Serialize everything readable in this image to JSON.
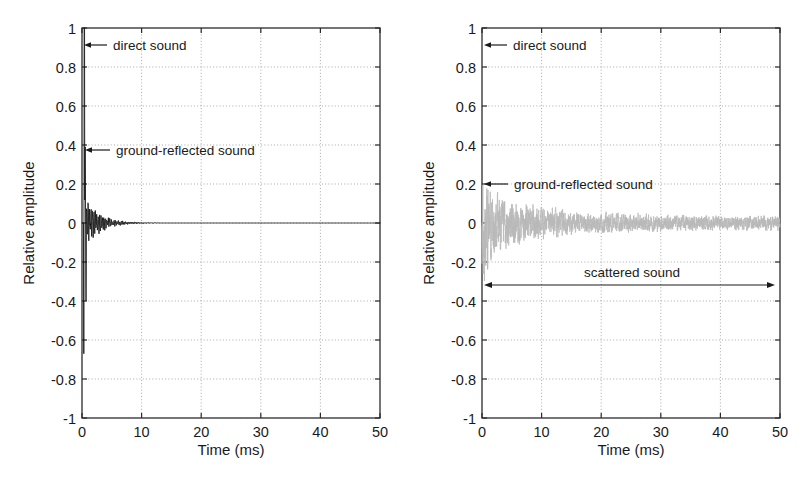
{
  "figure": {
    "background": "#ffffff",
    "panel_count": 2
  },
  "chart_data": [
    {
      "id": "left-panel",
      "type": "line",
      "title": "",
      "xlabel": "Time (ms)",
      "ylabel": "Relative amplitude",
      "xlim": [
        0,
        50
      ],
      "ylim": [
        -1,
        1
      ],
      "xticks": [
        0,
        10,
        20,
        30,
        40,
        50
      ],
      "xticklabels": [
        "0",
        "10",
        "20",
        "30",
        "40",
        "50"
      ],
      "yticks": [
        -1,
        -0.8,
        -0.6,
        -0.4,
        -0.2,
        0,
        0.2,
        0.4,
        0.6,
        0.8,
        1
      ],
      "yticklabels": [
        "-1",
        "-0.8",
        "-0.6",
        "-0.4",
        "-0.2",
        "0",
        "0.2",
        "0.4",
        "0.6",
        "0.8",
        "1"
      ],
      "grid": true,
      "grid_style": "dotted",
      "legend": "none",
      "series": [
        {
          "name": "impulse response (hard ground, free field)",
          "color": "#111111",
          "description": "Large direct-sound impulse near t=0 reaching +1 / -0.67, a ground-reflected impulse of about +0.40, then rapidly decaying oscillation settling to zero by about 12 ms."
        }
      ],
      "annotations": [
        {
          "name": "direct-sound",
          "text": "direct sound",
          "arrow": "left",
          "points_to_x_ms": 0.3,
          "points_to_y": 0.92
        },
        {
          "name": "ground-reflected-sound",
          "text": "ground-reflected sound",
          "arrow": "left",
          "points_to_x_ms": 0.5,
          "points_to_y": 0.4
        }
      ]
    },
    {
      "id": "right-panel",
      "type": "line",
      "title": "",
      "xlabel": "Time (ms)",
      "ylabel": "Relative amplitude",
      "xlim": [
        0,
        50
      ],
      "ylim": [
        -1,
        1
      ],
      "xticks": [
        0,
        10,
        20,
        30,
        40,
        50
      ],
      "xticklabels": [
        "0",
        "10",
        "20",
        "30",
        "40",
        "50"
      ],
      "yticks": [
        -1,
        -0.8,
        -0.6,
        -0.4,
        -0.2,
        0,
        0.2,
        0.4,
        0.6,
        0.8,
        1
      ],
      "yticklabels": [
        "-1",
        "-0.8",
        "-0.6",
        "-0.4",
        "-0.2",
        "0",
        "0.2",
        "0.4",
        "0.6",
        "0.8",
        "1"
      ],
      "grid": true,
      "grid_style": "dotted",
      "legend": "none",
      "series": [
        {
          "name": "impulse response (scattering ground)",
          "color": "#b9b9b9",
          "description": "Low-amplitude noisy signal, peaks about +0.19 / -0.28 in the first 10 ms, decaying slowly to about +/-0.03 by 50 ms."
        }
      ],
      "annotations": [
        {
          "name": "direct-sound",
          "text": "direct sound",
          "arrow": "left",
          "points_to_x_ms": 0.3,
          "points_to_y": 0.92
        },
        {
          "name": "ground-reflected-sound",
          "text": "ground-reflected sound",
          "arrow": "left",
          "points_to_x_ms": 0.3,
          "points_to_y": 0.2
        },
        {
          "name": "scattered-sound",
          "text": "scattered sound",
          "arrow": "double",
          "span_x_ms": [
            2.0,
            49.0
          ],
          "points_to_y": -0.32
        }
      ]
    }
  ]
}
